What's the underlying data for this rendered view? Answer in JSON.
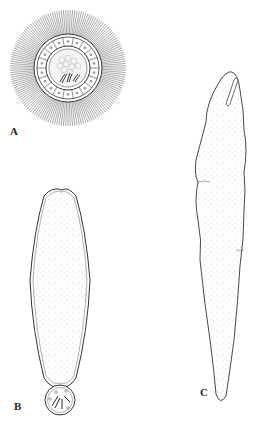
{
  "figure": {
    "panels": [
      {
        "id": "A",
        "label": "A",
        "description": "circular cross-section with radiating spines, ring of cells, granular core with spindle-shaped bodies"
      },
      {
        "id": "B",
        "label": "B",
        "description": "elongated sac-like body with stippled interior attached to small round bulb containing rod-shaped bodies"
      },
      {
        "id": "C",
        "label": "C",
        "description": "elongated tapering stippled body with slit-like anterior opening"
      }
    ],
    "colors": {
      "ink": "#333333",
      "stipple": "#9a9a9a",
      "background": "#ffffff"
    }
  }
}
